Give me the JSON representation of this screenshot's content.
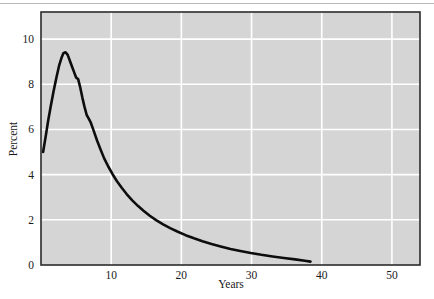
{
  "figure": {
    "top_rule_visible": true,
    "background_color": "#ffffff",
    "plot_background_color": "#d5d5d5",
    "plot_border_color": "#2b2b2b",
    "gridline_color": "#ffffff",
    "line_color": "#0d0d0d"
  },
  "chart_data": {
    "type": "line",
    "title": "",
    "xlabel": "Years",
    "ylabel": "Percent",
    "xlim": [
      0,
      54
    ],
    "ylim": [
      0,
      11.2
    ],
    "xticks": [
      10,
      20,
      30,
      40,
      50
    ],
    "xtick_labels": [
      "10",
      "20",
      "30",
      "40",
      "50"
    ],
    "yticks": [
      0,
      2,
      4,
      6,
      8,
      10
    ],
    "ytick_labels": [
      "0",
      "2",
      "4",
      "6",
      "8",
      "10"
    ],
    "grid": true,
    "grid_color": "#ffffff",
    "legend": "none",
    "series": [
      {
        "name": "Percent by year",
        "color": "#0d0d0d",
        "line_width": 2.6,
        "x": [
          0.3,
          0.7,
          1.0,
          1.4,
          1.8,
          2.2,
          2.6,
          2.9,
          3.2,
          3.5,
          3.8,
          4.1,
          4.4,
          4.7,
          5.0,
          5.3,
          5.6,
          5.9,
          6.2,
          6.5,
          6.8,
          7.1,
          7.5,
          8.0,
          8.5,
          9.0,
          9.6,
          10.2,
          10.8,
          11.5,
          12.2,
          13.0,
          13.8,
          14.6,
          15.5,
          16.4,
          17.4,
          18.4,
          19.5,
          20.6,
          21.8,
          23.0,
          24.3,
          25.6,
          27.0,
          28.4,
          29.9,
          31.4,
          33.0,
          34.6,
          36.2,
          37.6,
          38.4
        ],
        "y": [
          5.0,
          5.75,
          6.35,
          7.05,
          7.7,
          8.3,
          8.85,
          9.15,
          9.38,
          9.42,
          9.3,
          9.05,
          8.8,
          8.55,
          8.3,
          8.22,
          7.85,
          7.4,
          7.0,
          6.65,
          6.48,
          6.3,
          5.95,
          5.5,
          5.1,
          4.72,
          4.35,
          4.02,
          3.72,
          3.42,
          3.14,
          2.86,
          2.62,
          2.4,
          2.18,
          1.99,
          1.8,
          1.63,
          1.47,
          1.32,
          1.18,
          1.05,
          0.93,
          0.82,
          0.71,
          0.62,
          0.53,
          0.45,
          0.38,
          0.31,
          0.25,
          0.19,
          0.15
        ]
      }
    ],
    "annotations": {
      "peak_value": 9.42,
      "peak_year": 3.5,
      "start_value": 5.0,
      "end_value": 0.15,
      "end_year": 38.4,
      "shoulder_1": {
        "year": 5.3,
        "value": 8.22
      },
      "shoulder_2": {
        "year": 6.8,
        "value": 6.48
      }
    }
  }
}
